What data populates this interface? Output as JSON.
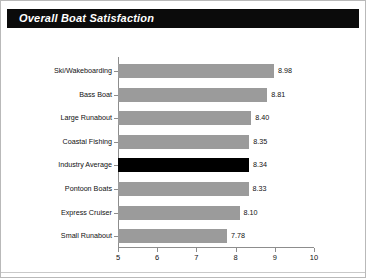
{
  "title": "Overall Boat Satisfaction",
  "chart_data": {
    "type": "bar",
    "orientation": "horizontal",
    "title": "Overall Boat Satisfaction",
    "xlabel": "",
    "ylabel": "",
    "xlim": [
      5,
      10
    ],
    "xticks": [
      "5",
      "6",
      "7",
      "8",
      "9",
      "10"
    ],
    "grid": false,
    "legend": null,
    "highlight_category": "Industry Average",
    "highlight_color": "#000000",
    "bar_color": "#9b9b9b",
    "categories": [
      "Ski/Wakeboarding",
      "Bass Boat",
      "Large Runabout",
      "Coastal Fishing",
      "Industry Average",
      "Pontoon Boats",
      "Express Cruiser",
      "Small Runabout"
    ],
    "values": [
      8.98,
      8.81,
      8.4,
      8.35,
      8.34,
      8.33,
      8.1,
      7.78
    ],
    "value_labels": [
      "8.98",
      "8.81",
      "8.40",
      "8.35",
      "8.34",
      "8.33",
      "8.10",
      "7.78"
    ]
  }
}
